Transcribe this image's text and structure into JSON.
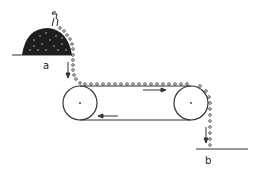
{
  "diagram": {
    "title": "",
    "labels": {
      "source": "a",
      "destination": "b"
    },
    "elements": {
      "pile": "heap of beads at source a",
      "belt": "conveyor belt with two pulleys",
      "beads": "chain of beads carried along belt",
      "arrows": [
        "down at a",
        "right along top of belt",
        "left along bottom of belt",
        "down at b"
      ]
    },
    "colors": {
      "ink": "#222222",
      "background": "#ffffff"
    }
  }
}
